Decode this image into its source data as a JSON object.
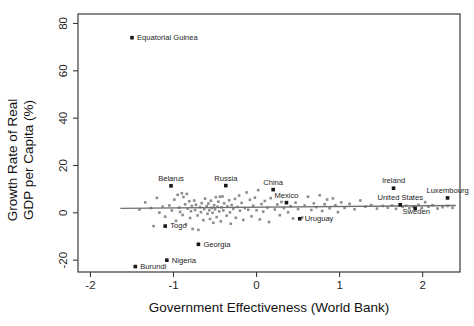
{
  "chart_data": {
    "type": "scatter",
    "title": "",
    "xlabel": "Government Effectiveness (World Bank)",
    "ylabel_line1": "Growth Rate of Real",
    "ylabel_line2": "GDP per Capita (%)",
    "xlim": [
      -2.15,
      2.45
    ],
    "ylim": [
      -25,
      84
    ],
    "xticks": [
      -2,
      -1,
      0,
      1,
      2
    ],
    "xtick_labels": [
      "-2",
      "-1",
      "0",
      "1",
      "2"
    ],
    "yticks": [
      -20,
      0,
      20,
      40,
      60,
      80
    ],
    "ytick_labels": [
      "-20",
      "0",
      "20",
      "40",
      "60",
      "80"
    ],
    "grid": false,
    "legend": null,
    "point_color": "#8d8d8d",
    "highlight_color": "#171717",
    "fit_line_color": "#6f6f6f",
    "fit_line": {
      "x_start": -1.64,
      "x_end": 2.4,
      "y_start": 1.9,
      "y_end": 3.1
    },
    "labeled_points": [
      {
        "name": "Equatorial Guinea",
        "x": -1.5,
        "y": 74.0,
        "label_dx": 5,
        "label_dy": 2.4,
        "anchor": "start"
      },
      {
        "name": "Belarus",
        "x": -1.03,
        "y": 11.4,
        "label_dx": 0,
        "label_dy": -5,
        "anchor": "middle"
      },
      {
        "name": "Russia",
        "x": -0.37,
        "y": 11.5,
        "label_dx": 0,
        "label_dy": -5,
        "anchor": "middle"
      },
      {
        "name": "China",
        "x": 0.2,
        "y": 9.8,
        "label_dx": 0,
        "label_dy": -5,
        "anchor": "middle"
      },
      {
        "name": "Mexico",
        "x": 0.36,
        "y": 4.3,
        "label_dx": 0,
        "label_dy": -4.6,
        "anchor": "middle"
      },
      {
        "name": "Ireland",
        "x": 1.65,
        "y": 10.4,
        "label_dx": 0,
        "label_dy": -5,
        "anchor": "middle"
      },
      {
        "name": "Luxembourg",
        "x": 2.3,
        "y": 6.3,
        "label_dx": 0,
        "label_dy": -5,
        "anchor": "middle"
      },
      {
        "name": "United States",
        "x": 1.73,
        "y": 3.4,
        "label_dx": 0,
        "label_dy": -4.6,
        "anchor": "middle"
      },
      {
        "name": "Sweden",
        "x": 1.91,
        "y": 1.9,
        "label_dx": 1,
        "label_dy": 5.8,
        "anchor": "middle"
      },
      {
        "name": "Uruguay",
        "x": 0.52,
        "y": -2.5,
        "label_dx": 5,
        "label_dy": 2.4,
        "anchor": "start"
      },
      {
        "name": "Togo",
        "x": -1.1,
        "y": -5.6,
        "label_dx": 5,
        "label_dy": 2.4,
        "anchor": "start"
      },
      {
        "name": "Georgia",
        "x": -0.7,
        "y": -13.3,
        "label_dx": 5,
        "label_dy": 2.4,
        "anchor": "start"
      },
      {
        "name": "Nigeria",
        "x": -1.08,
        "y": -20.0,
        "label_dx": 5,
        "label_dy": 2.4,
        "anchor": "start"
      },
      {
        "name": "Burundi",
        "x": -1.46,
        "y": -22.7,
        "label_dx": 5,
        "label_dy": 2.4,
        "anchor": "start"
      }
    ],
    "points": [
      {
        "x": -1.41,
        "y": 1.4
      },
      {
        "x": -1.34,
        "y": 4.4
      },
      {
        "x": -1.27,
        "y": 2.0
      },
      {
        "x": -1.24,
        "y": -5.6
      },
      {
        "x": -1.2,
        "y": 6.3
      },
      {
        "x": -1.17,
        "y": 0.1
      },
      {
        "x": -1.13,
        "y": 2.6
      },
      {
        "x": -1.1,
        "y": -1.6
      },
      {
        "x": -1.05,
        "y": 3.1
      },
      {
        "x": -1.02,
        "y": 1.0
      },
      {
        "x": -0.99,
        "y": 5.6
      },
      {
        "x": -0.97,
        "y": -3.4
      },
      {
        "x": -0.95,
        "y": 7.6
      },
      {
        "x": -0.93,
        "y": 2.2
      },
      {
        "x": -0.92,
        "y": 0.4
      },
      {
        "x": -0.9,
        "y": 8.3
      },
      {
        "x": -0.89,
        "y": -0.9
      },
      {
        "x": -0.88,
        "y": 6.7
      },
      {
        "x": -0.86,
        "y": 3.6
      },
      {
        "x": -0.85,
        "y": -4.8
      },
      {
        "x": -0.84,
        "y": 8.0
      },
      {
        "x": -0.83,
        "y": 1.8
      },
      {
        "x": -0.81,
        "y": 4.9
      },
      {
        "x": -0.8,
        "y": -2.2
      },
      {
        "x": -0.79,
        "y": 0.7
      },
      {
        "x": -0.78,
        "y": 2.9
      },
      {
        "x": -0.77,
        "y": -6.8
      },
      {
        "x": -0.75,
        "y": 5.2
      },
      {
        "x": -0.74,
        "y": 1.2
      },
      {
        "x": -0.73,
        "y": 3.4
      },
      {
        "x": -0.71,
        "y": -1.1
      },
      {
        "x": -0.7,
        "y": -7.2
      },
      {
        "x": -0.68,
        "y": 2.4
      },
      {
        "x": -0.67,
        "y": 0.3
      },
      {
        "x": -0.66,
        "y": 4.1
      },
      {
        "x": -0.64,
        "y": -3.1
      },
      {
        "x": -0.63,
        "y": 1.6
      },
      {
        "x": -0.62,
        "y": 6.0
      },
      {
        "x": -0.6,
        "y": 2.8
      },
      {
        "x": -0.59,
        "y": -0.4
      },
      {
        "x": -0.58,
        "y": 3.9
      },
      {
        "x": -0.57,
        "y": 1.1
      },
      {
        "x": -0.56,
        "y": -2.6
      },
      {
        "x": -0.55,
        "y": 5.1
      },
      {
        "x": -0.54,
        "y": 2.1
      },
      {
        "x": -0.53,
        "y": 0.0
      },
      {
        "x": -0.52,
        "y": -4.2
      },
      {
        "x": -0.51,
        "y": 3.2
      },
      {
        "x": -0.5,
        "y": 1.5
      },
      {
        "x": -0.49,
        "y": 6.6
      },
      {
        "x": -0.48,
        "y": -1.8
      },
      {
        "x": -0.47,
        "y": 2.6
      },
      {
        "x": -0.46,
        "y": 4.7
      },
      {
        "x": -0.45,
        "y": 0.6
      },
      {
        "x": -0.44,
        "y": 6.8
      },
      {
        "x": -0.43,
        "y": -3.6
      },
      {
        "x": -0.42,
        "y": 2.3
      },
      {
        "x": -0.41,
        "y": 6.9
      },
      {
        "x": -0.4,
        "y": 1.0
      },
      {
        "x": -0.39,
        "y": 4.0
      },
      {
        "x": -0.36,
        "y": -1.2
      },
      {
        "x": -0.35,
        "y": 2.7
      },
      {
        "x": -0.33,
        "y": 5.3
      },
      {
        "x": -0.32,
        "y": 0.2
      },
      {
        "x": -0.31,
        "y": -4.6
      },
      {
        "x": -0.3,
        "y": 3.3
      },
      {
        "x": -0.28,
        "y": 1.7
      },
      {
        "x": -0.26,
        "y": 5.9
      },
      {
        "x": -0.25,
        "y": -2.1
      },
      {
        "x": -0.23,
        "y": 2.5
      },
      {
        "x": -0.21,
        "y": 7.3
      },
      {
        "x": -0.2,
        "y": 0.9
      },
      {
        "x": -0.18,
        "y": 4.2
      },
      {
        "x": -0.16,
        "y": -3.0
      },
      {
        "x": -0.14,
        "y": 2.0
      },
      {
        "x": -0.12,
        "y": 8.6
      },
      {
        "x": -0.1,
        "y": 1.3
      },
      {
        "x": -0.08,
        "y": 5.5
      },
      {
        "x": -0.06,
        "y": -1.5
      },
      {
        "x": -0.04,
        "y": 3.0
      },
      {
        "x": -0.02,
        "y": 6.4
      },
      {
        "x": 0.0,
        "y": 1.1
      },
      {
        "x": 0.02,
        "y": 9.6
      },
      {
        "x": 0.04,
        "y": -2.8
      },
      {
        "x": 0.06,
        "y": 3.7
      },
      {
        "x": 0.08,
        "y": 0.5
      },
      {
        "x": 0.1,
        "y": 5.0
      },
      {
        "x": 0.13,
        "y": 2.2
      },
      {
        "x": 0.15,
        "y": -3.9
      },
      {
        "x": 0.17,
        "y": 6.2
      },
      {
        "x": 0.22,
        "y": 1.4
      },
      {
        "x": 0.25,
        "y": 3.5
      },
      {
        "x": 0.28,
        "y": -1.0
      },
      {
        "x": 0.3,
        "y": 4.6
      },
      {
        "x": 0.33,
        "y": 2.0
      },
      {
        "x": 0.38,
        "y": 0.2
      },
      {
        "x": 0.41,
        "y": 2.8
      },
      {
        "x": 0.44,
        "y": -2.4
      },
      {
        "x": 0.47,
        "y": 4.3
      },
      {
        "x": 0.5,
        "y": 1.6
      },
      {
        "x": 0.55,
        "y": -2.0
      },
      {
        "x": 0.58,
        "y": 3.1
      },
      {
        "x": 0.62,
        "y": 6.8
      },
      {
        "x": 0.66,
        "y": 1.2
      },
      {
        "x": 0.69,
        "y": 4.0
      },
      {
        "x": 0.72,
        "y": 2.4
      },
      {
        "x": 0.76,
        "y": 7.4
      },
      {
        "x": 0.79,
        "y": 0.8
      },
      {
        "x": 0.82,
        "y": 3.6
      },
      {
        "x": 0.85,
        "y": 5.6
      },
      {
        "x": 0.88,
        "y": 1.9
      },
      {
        "x": 0.92,
        "y": 6.1
      },
      {
        "x": 0.95,
        "y": 3.2
      },
      {
        "x": 0.98,
        "y": 0.3
      },
      {
        "x": 1.02,
        "y": 4.4
      },
      {
        "x": 1.06,
        "y": 2.1
      },
      {
        "x": 1.12,
        "y": 3.8
      },
      {
        "x": 1.18,
        "y": 1.5
      },
      {
        "x": 1.25,
        "y": 5.2
      },
      {
        "x": 1.31,
        "y": 2.6
      },
      {
        "x": 1.38,
        "y": 3.3
      },
      {
        "x": 1.45,
        "y": 1.8
      },
      {
        "x": 1.52,
        "y": 2.9
      },
      {
        "x": 1.58,
        "y": 2.2
      },
      {
        "x": 1.63,
        "y": 3.1
      },
      {
        "x": 1.68,
        "y": 1.7
      },
      {
        "x": 1.76,
        "y": 2.5
      },
      {
        "x": 1.8,
        "y": 3.0
      },
      {
        "x": 1.84,
        "y": 1.9
      },
      {
        "x": 1.88,
        "y": 2.7
      },
      {
        "x": 1.95,
        "y": 3.4
      },
      {
        "x": 1.99,
        "y": 2.0
      },
      {
        "x": 2.03,
        "y": 4.5
      },
      {
        "x": 2.07,
        "y": 2.6
      },
      {
        "x": 2.12,
        "y": 3.2
      },
      {
        "x": 2.18,
        "y": 1.8
      },
      {
        "x": 2.24,
        "y": 2.4
      },
      {
        "x": 2.3,
        "y": 2.9
      },
      {
        "x": 2.36,
        "y": 2.1
      }
    ]
  }
}
